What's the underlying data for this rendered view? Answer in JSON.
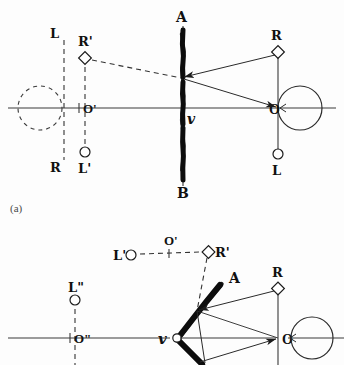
{
  "figure": {
    "caption_a": "(a)",
    "background_color": "#fdfdfd",
    "ink_color": "#111111"
  },
  "panel_a": {
    "name": "plane-mirror-panel",
    "mirror": {
      "top_label": "ℬ",
      "top_label_display": "A",
      "bottom_label": "B",
      "vertex_label": "v",
      "orientation": "vertical"
    },
    "real_side": {
      "center_label": "O",
      "right_marker_label": "R",
      "bottom_marker_label": "L",
      "eye_label": ""
    },
    "virtual_side": {
      "center_label": "O'",
      "upper_marker_label": "R'",
      "lower_marker_label": "L'",
      "dashed_top_label": "L",
      "dashed_bottom_label": "R"
    },
    "markers": {
      "diamond_means": "R point",
      "circle_means": "L point"
    }
  },
  "panel_b": {
    "name": "bent-mirror-panel",
    "mirror": {
      "top_label": "ℬ",
      "top_label_display": "A",
      "bottom_label": "B",
      "vertex_label": "v",
      "orientation": "bent-v"
    },
    "real_side": {
      "center_label": "O",
      "right_marker_label": "R",
      "bottom_marker_label": "L"
    },
    "virtual_row": {
      "left_marker_label": "L'",
      "center_label": "O'",
      "right_marker_label": "R'"
    },
    "second_virtual": {
      "center_label": "O\"",
      "upper_marker_label": "L\"",
      "lower_marker_label": "R\""
    }
  },
  "icons": {
    "diamond": "diamond-marker",
    "circle": "circle-marker",
    "eye": "eye-symbol",
    "arrow": "ray-arrowhead"
  }
}
